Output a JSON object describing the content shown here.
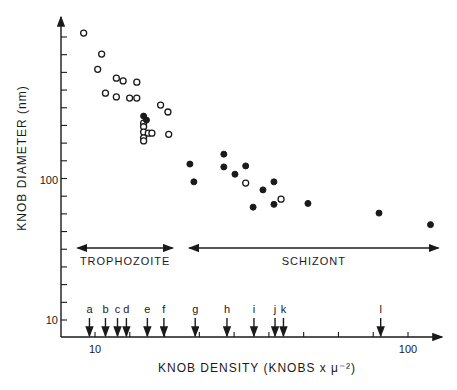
{
  "chart_data": {
    "type": "scatter",
    "title": "",
    "xlabel": "KNOB DENSITY (KNOBS x μ⁻²)",
    "ylabel": "KNOB DIAMETER (nm)",
    "xscale": "log",
    "yscale": "log",
    "xlim": [
      8.5,
      140
    ],
    "ylim": [
      7.4,
      1300
    ],
    "x_tick_labels": [
      {
        "value": 10,
        "label": "10"
      },
      {
        "value": 100,
        "label": "100"
      }
    ],
    "y_tick_labels": [
      {
        "value": 10,
        "label": "10"
      },
      {
        "value": 100,
        "label": "100"
      }
    ],
    "grid": false,
    "series": [
      {
        "name": "open circles",
        "marker": "open-circle",
        "points": [
          [
            9.2,
            1120
          ],
          [
            10.5,
            794
          ],
          [
            10.2,
            617
          ],
          [
            11.7,
            534
          ],
          [
            12.3,
            510
          ],
          [
            13.6,
            500
          ],
          [
            10.8,
            417
          ],
          [
            11.7,
            392
          ],
          [
            12.9,
            385
          ],
          [
            13.6,
            385
          ],
          [
            16.2,
            343
          ],
          [
            17.1,
            306
          ],
          [
            14.3,
            255
          ],
          [
            14.3,
            240
          ],
          [
            14.3,
            220
          ],
          [
            14.3,
            200
          ],
          [
            14.3,
            190
          ],
          [
            14.8,
            216
          ],
          [
            15.2,
            216
          ],
          [
            17.2,
            212
          ],
          [
            30.3,
            95
          ],
          [
            39.3,
            73
          ]
        ]
      },
      {
        "name": "filled circles",
        "marker": "filled-circle",
        "points": [
          [
            14.3,
            286
          ],
          [
            14.6,
            268
          ],
          [
            20.1,
            130
          ],
          [
            20.7,
            97
          ],
          [
            25.8,
            153
          ],
          [
            25.8,
            124
          ],
          [
            28.0,
            110
          ],
          [
            30.3,
            126
          ],
          [
            34.4,
            85
          ],
          [
            37.3,
            97
          ],
          [
            32.0,
            64
          ],
          [
            37.3,
            67
          ],
          [
            47.9,
            68
          ],
          [
            80.8,
            58
          ],
          [
            118,
            48
          ]
        ]
      }
    ],
    "annotations": {
      "phases": [
        {
          "label": "TROPHOZOITE",
          "x_start": 8.8,
          "x_end": 17.7
        },
        {
          "label": "SCHIZONT",
          "x_start": 20.0,
          "x_end": 125
        }
      ],
      "arrows": [
        {
          "label": "a",
          "x": 9.6
        },
        {
          "label": "b",
          "x": 10.8
        },
        {
          "label": "c",
          "x": 11.8
        },
        {
          "label": "d",
          "x": 12.6
        },
        {
          "label": "e",
          "x": 14.7
        },
        {
          "label": "f",
          "x": 16.6
        },
        {
          "label": "g",
          "x": 20.9
        },
        {
          "label": "h",
          "x": 26.4
        },
        {
          "label": "i",
          "x": 32.2
        },
        {
          "label": "j",
          "x": 37.6
        },
        {
          "label": "k",
          "x": 40.0
        },
        {
          "label": "l",
          "x": 81.8
        }
      ]
    }
  },
  "layout": {
    "x10_px": 95,
    "x100_px": 408,
    "y10_px": 320,
    "y100_px": 180,
    "origin_x": 61,
    "origin_y": 337,
    "x_axis_end": 442,
    "y_axis_top": 17,
    "colors": {
      "ink": "#1a1a1a",
      "background": "#ffffff"
    }
  }
}
